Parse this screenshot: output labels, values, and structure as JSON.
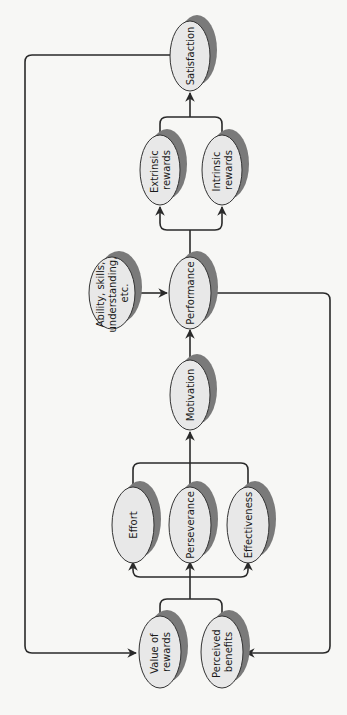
{
  "diagram": {
    "orientation": "rotated-90-ccw",
    "colors": {
      "background": "#f7f7f5",
      "node_fill": "#e8e8e8",
      "node_stroke": "#333333",
      "shadow": "#7a7a7a",
      "line": "#2a2a2a"
    },
    "nodes": {
      "satisfaction": {
        "lines": [
          "Satisfaction"
        ]
      },
      "extrinsic_rewards": {
        "lines": [
          "Extrinsic",
          "rewards"
        ]
      },
      "intrinsic_rewards": {
        "lines": [
          "Intrinsic",
          "rewards"
        ]
      },
      "ability": {
        "lines": [
          "Ability, skills,",
          "understanding,",
          "etc."
        ]
      },
      "performance": {
        "lines": [
          "Performance"
        ]
      },
      "motivation": {
        "lines": [
          "Motivation"
        ]
      },
      "effort": {
        "lines": [
          "Effort"
        ]
      },
      "perseverance": {
        "lines": [
          "Perseverance"
        ]
      },
      "effectiveness": {
        "lines": [
          "Effectiveness"
        ]
      },
      "value_of_rewards": {
        "lines": [
          "Value of",
          "rewards"
        ]
      },
      "perceived_benefits": {
        "lines": [
          "Perceived",
          "benefits"
        ]
      }
    },
    "edges": [
      {
        "from": "value_of_rewards",
        "to": "effort"
      },
      {
        "from": "value_of_rewards",
        "to": "perseverance"
      },
      {
        "from": "value_of_rewards",
        "to": "effectiveness"
      },
      {
        "from": "perceived_benefits",
        "to": "effort"
      },
      {
        "from": "perceived_benefits",
        "to": "perseverance"
      },
      {
        "from": "perceived_benefits",
        "to": "effectiveness"
      },
      {
        "from": "effort",
        "to": "motivation"
      },
      {
        "from": "perseverance",
        "to": "motivation"
      },
      {
        "from": "effectiveness",
        "to": "motivation"
      },
      {
        "from": "motivation",
        "to": "performance"
      },
      {
        "from": "ability",
        "to": "performance"
      },
      {
        "from": "performance",
        "to": "extrinsic_rewards"
      },
      {
        "from": "performance",
        "to": "intrinsic_rewards"
      },
      {
        "from": "performance",
        "to": "perceived_benefits"
      },
      {
        "from": "extrinsic_rewards",
        "to": "satisfaction"
      },
      {
        "from": "intrinsic_rewards",
        "to": "satisfaction"
      },
      {
        "from": "satisfaction",
        "to": "value_of_rewards"
      }
    ]
  }
}
